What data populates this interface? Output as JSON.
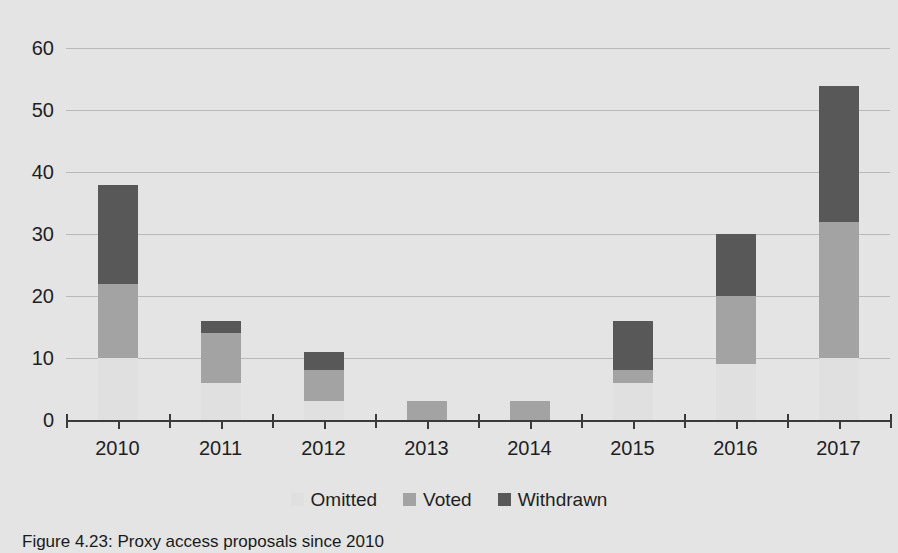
{
  "chart_data": {
    "type": "bar",
    "subtype": "stacked-bar",
    "title": "",
    "xlabel": "",
    "ylabel": "",
    "categories": [
      "2010",
      "2011",
      "2012",
      "2013",
      "2014",
      "2015",
      "2016",
      "2017"
    ],
    "series": [
      {
        "name": "Omitted",
        "color": "#e0e0e0",
        "values": [
          10,
          6,
          3,
          0,
          0,
          6,
          9,
          10
        ]
      },
      {
        "name": "Voted",
        "color": "#a3a3a3",
        "values": [
          12,
          8,
          5,
          3,
          3,
          2,
          11,
          22
        ]
      },
      {
        "name": "Withdrawn",
        "color": "#585858",
        "values": [
          16,
          2,
          3,
          0,
          0,
          8,
          10,
          22
        ]
      }
    ],
    "totals": [
      38,
      16,
      11,
      3,
      3,
      16,
      30,
      54
    ],
    "ylim": [
      0,
      62
    ],
    "yticks": [
      0,
      10,
      20,
      30,
      40,
      50,
      60
    ],
    "ytick_labels": [
      "0",
      "10",
      "20",
      "30",
      "40",
      "50",
      "60"
    ],
    "grid": "horizontal",
    "legend_position": "bottom"
  },
  "legend": {
    "items": [
      {
        "label": "Omitted",
        "color": "#e0e0e0"
      },
      {
        "label": "Voted",
        "color": "#a3a3a3"
      },
      {
        "label": "Withdrawn",
        "color": "#585858"
      }
    ]
  },
  "caption": {
    "text": "Figure 4.23: Proxy access proposals since 2010"
  },
  "colors": {
    "background": "#e4e4e4",
    "gridline": "#b9b9b9",
    "axis": "#3b3b3b",
    "text": "#1f1f1f"
  }
}
